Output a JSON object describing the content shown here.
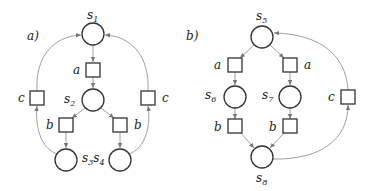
{
  "panels": [
    {
      "id": "a",
      "label": "a)",
      "places": [
        {
          "id": "s1",
          "name": "s",
          "sub": "1",
          "cx": 93,
          "cy": 34
        },
        {
          "id": "s2",
          "name": "s",
          "sub": "2",
          "cx": 93,
          "cy": 100
        },
        {
          "id": "s3",
          "name": "s",
          "sub": "3",
          "cx": 66,
          "cy": 160
        },
        {
          "id": "s4",
          "name": "s",
          "sub": "4",
          "cx": 120,
          "cy": 160
        }
      ],
      "transitions": [
        {
          "id": "ta",
          "label": "a",
          "cx": 93,
          "cy": 70
        },
        {
          "id": "tbl",
          "label": "b",
          "cx": 66,
          "cy": 125
        },
        {
          "id": "tbr",
          "label": "b",
          "cx": 120,
          "cy": 125
        },
        {
          "id": "tcl",
          "label": "c",
          "cx": 37,
          "cy": 98
        },
        {
          "id": "tcr",
          "label": "c",
          "cx": 148,
          "cy": 98
        }
      ],
      "combined_label": "s3s4"
    },
    {
      "id": "b",
      "label": "b)",
      "places": [
        {
          "id": "s5",
          "name": "s",
          "sub": "5",
          "cx": 262,
          "cy": 37
        },
        {
          "id": "s6",
          "name": "s",
          "sub": "6",
          "cx": 235,
          "cy": 97
        },
        {
          "id": "s7",
          "name": "s",
          "sub": "7",
          "cx": 290,
          "cy": 97
        },
        {
          "id": "s8",
          "name": "s",
          "sub": "8",
          "cx": 262,
          "cy": 157
        }
      ],
      "transitions": [
        {
          "id": "tal",
          "label": "a",
          "cx": 235,
          "cy": 65
        },
        {
          "id": "tar",
          "label": "a",
          "cx": 290,
          "cy": 65
        },
        {
          "id": "tbl",
          "label": "b",
          "cx": 235,
          "cy": 126
        },
        {
          "id": "tbr",
          "label": "b",
          "cx": 290,
          "cy": 126
        },
        {
          "id": "tc",
          "label": "c",
          "cx": 348,
          "cy": 97
        }
      ]
    }
  ],
  "labels": {
    "a_panel": "a)",
    "b_panel": "b)",
    "t_a": "a",
    "t_b": "b",
    "t_c": "c",
    "s": "s",
    "s1_sub": "1",
    "s2_sub": "2",
    "s3_sub": "3",
    "s4_sub": "4",
    "s5_sub": "5",
    "s6_sub": "6",
    "s7_sub": "7",
    "s8_sub": "8"
  }
}
